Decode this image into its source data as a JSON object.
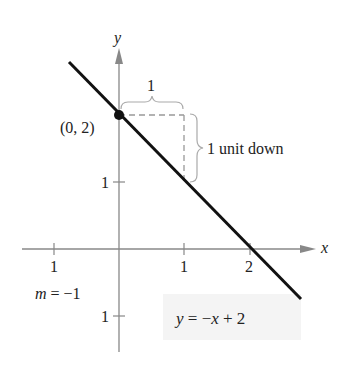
{
  "diagram": {
    "axes": {
      "x_label": "x",
      "y_label": "y",
      "x_ticks": [
        {
          "value": -1,
          "label": "1"
        },
        {
          "value": 1,
          "label": "1"
        },
        {
          "value": 2,
          "label": "2"
        }
      ],
      "y_ticks": [
        {
          "value": 1,
          "label": "1"
        },
        {
          "value": -1,
          "label": "1"
        }
      ]
    },
    "line": {
      "equation": "y = −x + 2",
      "slope_label": "m = −1",
      "color": "#111111"
    },
    "point": {
      "label": "(0, 2)",
      "x": 0,
      "y": 2
    },
    "annotations": {
      "run_label": "1",
      "rise_label": "1 unit down"
    },
    "colors": {
      "axis": "#888888",
      "dashed": "#999999",
      "line": "#111111",
      "equation_bg": "#f4f4f4"
    }
  }
}
